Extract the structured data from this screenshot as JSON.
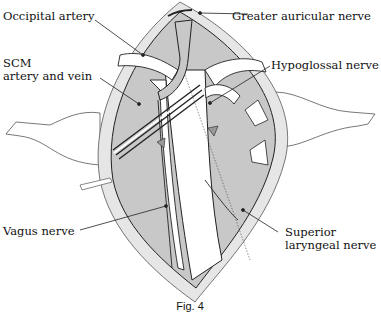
{
  "figure": {
    "caption": "Fig. 4",
    "colors": {
      "background": "#ffffff",
      "skin_border": "#e6e6e6",
      "muscle_fill": "#c8c8c8",
      "structure_fill": "#ffffff",
      "stroke": "#222222"
    }
  },
  "labels": {
    "occipital_artery": "Occipital artery",
    "scm_line1": "SCM",
    "scm_line2": "artery and vein",
    "vagus_nerve": "Vagus nerve",
    "greater_auricular_nerve": "Greater auricular nerve",
    "hypoglossal_nerve": "Hypoglossal nerve",
    "superior_line1": "Superior",
    "superior_line2": "laryngeal nerve"
  }
}
